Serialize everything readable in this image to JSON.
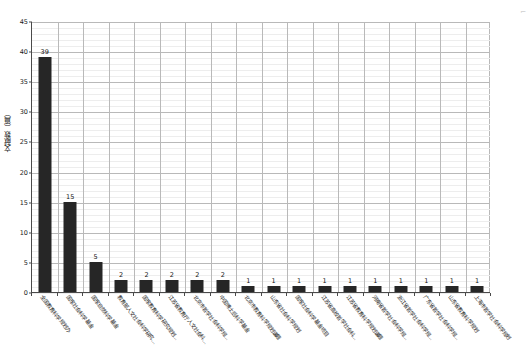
{
  "chart_data": {
    "type": "bar",
    "title": "",
    "subtitle": "",
    "xlabel": "",
    "ylabel": "文献数（篇）",
    "ylim": [
      0,
      45
    ],
    "ytick_step": 5,
    "yticks": [
      0,
      5,
      10,
      15,
      20,
      25,
      30,
      35,
      40,
      45
    ],
    "grid": true,
    "grid_minor": true,
    "legend": false,
    "legend_position": "none",
    "bar_color": "#262626",
    "orientation": "vertical",
    "data_labels": true,
    "categories": [
      "全国教育科学规划办",
      "国家社会科学基金",
      "国家自然科学基金",
      "教育部人文社会科学研究…",
      "国家教育科学研究规划…",
      "江苏省教育厅人文社会科…",
      "北京市哲学社会科学规…",
      "中国博士后科学基金",
      "北京市教育科学规划课题",
      "山东省社会科学规划",
      "国家社会科学基金项目",
      "江苏省高校哲学社会科…",
      "江苏省教育科学规划课题",
      "河南省哲学社会科学规…",
      "浙江省哲学社会科学规…",
      "广东省哲学社会科学规…",
      "山东省教育科学规划",
      "上海市哲学社会科学规划"
    ],
    "values": [
      39,
      15,
      5,
      2,
      2,
      2,
      2,
      2,
      1,
      1,
      1,
      1,
      1,
      1,
      1,
      1,
      1,
      1
    ],
    "value_labels": [
      "39",
      "15",
      "5",
      "2",
      "2",
      "2",
      "2",
      "2",
      "1",
      "1",
      "1",
      "1",
      "1",
      "1",
      "1",
      "1",
      "1",
      "1"
    ]
  }
}
